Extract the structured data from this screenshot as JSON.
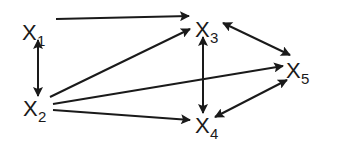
{
  "diagram": {
    "type": "directed-graph",
    "nodes": [
      {
        "id": "X1",
        "letter": "X",
        "subscript": "1",
        "x": 22,
        "y": 40
      },
      {
        "id": "X2",
        "letter": "X",
        "subscript": "2",
        "x": 23,
        "y": 116
      },
      {
        "id": "X3",
        "letter": "X",
        "subscript": "3",
        "x": 195,
        "y": 37
      },
      {
        "id": "X4",
        "letter": "X",
        "subscript": "4",
        "x": 195,
        "y": 133
      },
      {
        "id": "X5",
        "letter": "X",
        "subscript": "5",
        "x": 286,
        "y": 78
      }
    ],
    "edges": [
      {
        "from": "X1",
        "to": "X3",
        "direction": "forward",
        "x1": 56,
        "y1": 19,
        "x2": 189,
        "y2": 16
      },
      {
        "from": "X1",
        "to": "X2",
        "direction": "bidirectional",
        "x1": 38,
        "y1": 40,
        "x2": 38,
        "y2": 96
      },
      {
        "from": "X2",
        "to": "X3",
        "direction": "forward",
        "x1": 50,
        "y1": 97,
        "x2": 190,
        "y2": 29
      },
      {
        "from": "X2",
        "to": "X5",
        "direction": "forward",
        "x1": 53,
        "y1": 104,
        "x2": 283,
        "y2": 66
      },
      {
        "from": "X2",
        "to": "X4",
        "direction": "forward",
        "x1": 53,
        "y1": 110,
        "x2": 190,
        "y2": 120
      },
      {
        "from": "X3",
        "to": "X4",
        "direction": "bidirectional",
        "x1": 203,
        "y1": 37,
        "x2": 203,
        "y2": 113
      },
      {
        "from": "X3",
        "to": "X5",
        "direction": "bidirectional",
        "x1": 223,
        "y1": 23,
        "x2": 290,
        "y2": 55
      },
      {
        "from": "X4",
        "to": "X5",
        "direction": "bidirectional",
        "x1": 215,
        "y1": 117,
        "x2": 287,
        "y2": 80
      }
    ]
  }
}
